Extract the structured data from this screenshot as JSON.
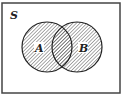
{
  "diagram": {
    "type": "venn",
    "universe_label": "S",
    "sets": [
      {
        "label": "A",
        "cx": 47,
        "cy": 47,
        "r": 25
      },
      {
        "label": "B",
        "cx": 77,
        "cy": 47,
        "r": 25
      }
    ],
    "shaded_region": "A ∪ B",
    "colors": {
      "stroke": "#222222",
      "hatch": "#555555",
      "background": "#ffffff"
    }
  }
}
